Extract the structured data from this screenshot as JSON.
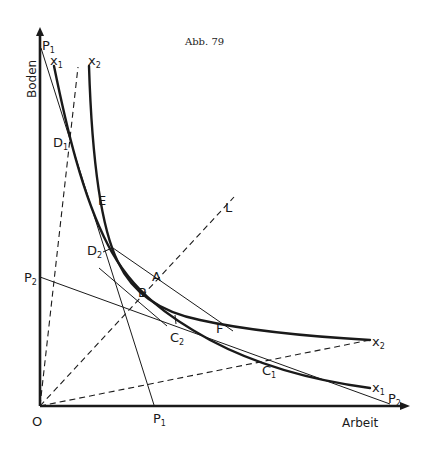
{
  "figure": {
    "caption": "Abb. 79",
    "y_axis_label": "Boden",
    "x_axis_label": "Arbeit",
    "origin_label": "O"
  },
  "labels": {
    "P1_top": {
      "main": "P",
      "sub": "1"
    },
    "P1_bottom": {
      "main": "P",
      "sub": "1"
    },
    "P2_left": {
      "main": "P",
      "sub": "2"
    },
    "P2_right": {
      "main": "P",
      "sub": "2"
    },
    "x1_top": {
      "main": "x",
      "sub": "1"
    },
    "x1_right": {
      "main": "x",
      "sub": "1"
    },
    "x2_top": {
      "main": "x",
      "sub": "2"
    },
    "x2_right": {
      "main": "x",
      "sub": "2"
    },
    "D1": {
      "main": "D",
      "sub": "1"
    },
    "D2": {
      "main": "D",
      "sub": "2"
    },
    "C1": {
      "main": "C",
      "sub": "1"
    },
    "C2": {
      "main": "C",
      "sub": "2"
    },
    "E": "E",
    "A": "A",
    "B": "B",
    "F": "F",
    "L": "L"
  },
  "colors": {
    "ink": "#1a1a1a",
    "background": "#ffffff"
  }
}
